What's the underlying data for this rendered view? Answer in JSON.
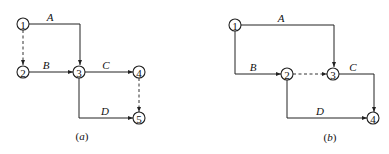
{
  "diagrams": [
    {
      "id": "a",
      "caption": "(a)",
      "caption_letter": "a",
      "nodes": [
        {
          "id": "1",
          "label": "1"
        },
        {
          "id": "2",
          "label": "2"
        },
        {
          "id": "3",
          "label": "3"
        },
        {
          "id": "4",
          "label": "4"
        },
        {
          "id": "5",
          "label": "5"
        }
      ],
      "edges": [
        {
          "from": "1",
          "to": "3",
          "label": "A",
          "dummy": false
        },
        {
          "from": "1",
          "to": "2",
          "label": "",
          "dummy": true
        },
        {
          "from": "2",
          "to": "3",
          "label": "B",
          "dummy": false
        },
        {
          "from": "3",
          "to": "4",
          "label": "C",
          "dummy": false
        },
        {
          "from": "3",
          "to": "5",
          "label": "D",
          "dummy": false
        },
        {
          "from": "4",
          "to": "5",
          "label": "",
          "dummy": true
        }
      ]
    },
    {
      "id": "b",
      "caption": "(b)",
      "caption_letter": "b",
      "nodes": [
        {
          "id": "1",
          "label": "1"
        },
        {
          "id": "2",
          "label": "2"
        },
        {
          "id": "3",
          "label": "3"
        },
        {
          "id": "4",
          "label": "4"
        }
      ],
      "edges": [
        {
          "from": "1",
          "to": "3",
          "label": "A",
          "dummy": false
        },
        {
          "from": "1",
          "to": "2",
          "label": "B",
          "dummy": false
        },
        {
          "from": "2",
          "to": "3",
          "label": "",
          "dummy": true
        },
        {
          "from": "3",
          "to": "4",
          "label": "C",
          "dummy": false
        },
        {
          "from": "2",
          "to": "4",
          "label": "D",
          "dummy": false
        }
      ]
    }
  ]
}
